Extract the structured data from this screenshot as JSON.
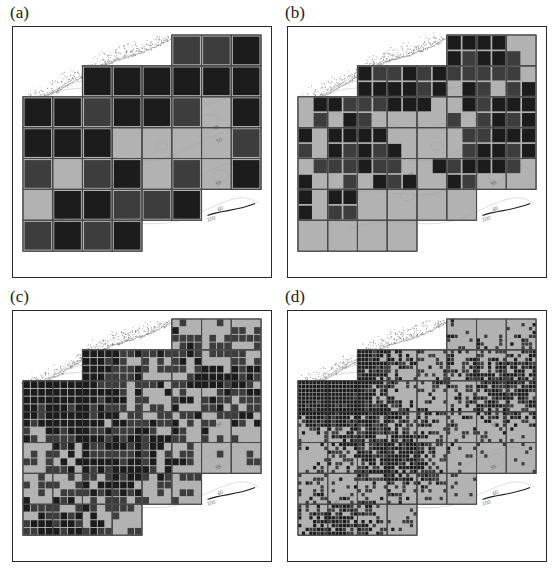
{
  "figure": {
    "type": "multi-panel-map-grid",
    "panel_count": 4,
    "background_color": "#ffffff"
  },
  "panels": [
    {
      "id": "a",
      "label": "(a)",
      "resolution_label": "coarse",
      "cols": 8,
      "rows": 7
    },
    {
      "id": "b",
      "label": "(b)",
      "resolution_label": "medium",
      "cols": 16,
      "rows": 14
    },
    {
      "id": "c",
      "label": "(c)",
      "resolution_label": "fine",
      "cols": 32,
      "rows": 28
    },
    {
      "id": "d",
      "label": "(d)",
      "resolution_label": "very-fine",
      "cols": 64,
      "rows": 56
    }
  ],
  "map": {
    "land_fill": "#b2b2b2",
    "land_outline": "#4a4a4a",
    "sea_fill": "#ffffff",
    "coastline_color": "#8a8a8a",
    "contour_color": "#9a9a9a",
    "contour_labels": [
      "45",
      "50",
      "55",
      "60",
      "100"
    ]
  },
  "legend_shades": {
    "dark": "#1c1c1c",
    "mid": "#3d3d3d",
    "light": "#b2b2b2"
  },
  "chart_data": {
    "type": "heatmap",
    "title": "",
    "subtitle": "",
    "xlabel": "",
    "ylabel": "",
    "grid": true,
    "legend_position": "none",
    "shade_levels": [
      "dark",
      "mid",
      "light"
    ],
    "shade_colors": [
      "#1c1c1c",
      "#3d3d3d",
      "#b2b2b2"
    ],
    "panels": [
      {
        "name": "(a)",
        "cell_size_px": 32,
        "counts": {
          "dark": 26,
          "mid": 9,
          "light": 10
        },
        "rows": [
          [
            0,
            0,
            0,
            0,
            0,
            3,
            3,
            3
          ],
          [
            0,
            0,
            3,
            3,
            3,
            3,
            3,
            3
          ],
          [
            3,
            3,
            3,
            3,
            3,
            3,
            1,
            3
          ],
          [
            3,
            3,
            3,
            1,
            1,
            1,
            1,
            3
          ],
          [
            3,
            1,
            3,
            3,
            1,
            3,
            1,
            3
          ],
          [
            1,
            3,
            3,
            3,
            3,
            3,
            0,
            0
          ],
          [
            3,
            3,
            3,
            3,
            0,
            0,
            0,
            0
          ]
        ]
      },
      {
        "name": "(b)",
        "cell_size_px": 16,
        "counts": {
          "dark": 70,
          "mid": 22,
          "light": 40
        },
        "rows": [
          [
            0,
            0,
            0,
            0,
            0,
            0,
            0,
            0,
            3,
            3,
            3,
            3,
            3,
            3,
            1,
            0
          ],
          [
            0,
            0,
            0,
            0,
            0,
            0,
            3,
            3,
            3,
            3,
            3,
            3,
            3,
            3,
            3,
            0
          ],
          [
            0,
            0,
            0,
            3,
            3,
            3,
            3,
            3,
            3,
            3,
            3,
            3,
            3,
            3,
            3,
            0
          ],
          [
            0,
            0,
            3,
            3,
            3,
            3,
            3,
            3,
            3,
            3,
            1,
            3,
            3,
            1,
            3,
            3
          ],
          [
            0,
            3,
            3,
            3,
            3,
            3,
            3,
            3,
            3,
            1,
            1,
            3,
            3,
            3,
            3,
            3
          ],
          [
            0,
            3,
            1,
            3,
            3,
            1,
            1,
            1,
            1,
            1,
            3,
            1,
            3,
            3,
            3,
            3
          ],
          [
            3,
            1,
            3,
            3,
            3,
            3,
            1,
            1,
            1,
            1,
            1,
            3,
            3,
            3,
            3,
            3
          ],
          [
            3,
            1,
            3,
            3,
            3,
            3,
            3,
            1,
            1,
            1,
            1,
            3,
            3,
            3,
            3,
            3
          ],
          [
            1,
            3,
            3,
            3,
            3,
            3,
            3,
            1,
            1,
            3,
            3,
            3,
            3,
            3,
            3,
            0
          ],
          [
            3,
            1,
            1,
            3,
            1,
            3,
            3,
            3,
            1,
            1,
            3,
            3,
            0,
            0,
            0,
            0
          ],
          [
            3,
            1,
            3,
            3,
            1,
            1,
            1,
            1,
            1,
            0,
            0,
            0,
            0,
            0,
            0,
            0
          ],
          [
            3,
            1,
            3,
            3,
            1,
            1,
            0,
            0,
            0,
            0,
            0,
            0,
            0,
            0,
            0,
            0
          ],
          [
            0,
            0,
            0,
            0,
            0,
            0,
            0,
            0,
            0,
            0,
            0,
            0,
            0,
            0,
            0,
            0
          ],
          [
            0,
            0,
            0,
            0,
            0,
            0,
            0,
            0,
            0,
            0,
            0,
            0,
            0,
            0,
            0,
            0
          ]
        ]
      },
      {
        "name": "(c)",
        "cell_size_px": 8,
        "counts": {
          "dark": 190,
          "mid": 55,
          "light": 260
        },
        "density": 0.45
      },
      {
        "name": "(d)",
        "cell_size_px": 4,
        "counts": {
          "dark": 420,
          "mid": 180,
          "light": 1600
        },
        "density": 0.22
      }
    ]
  }
}
